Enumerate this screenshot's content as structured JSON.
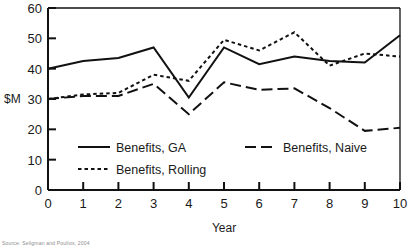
{
  "chart_data": {
    "type": "line",
    "title": "",
    "xlabel": "Year",
    "ylabel": "$M",
    "x": [
      0,
      1,
      2,
      3,
      4,
      5,
      6,
      7,
      8,
      9,
      10
    ],
    "xlim": [
      0,
      10
    ],
    "ylim": [
      0,
      60
    ],
    "xticks": [
      "0",
      "1",
      "2",
      "3",
      "4",
      "5",
      "6",
      "7",
      "8",
      "9",
      "10"
    ],
    "yticks": [
      "0",
      "10",
      "20",
      "30",
      "40",
      "50",
      "60"
    ],
    "grid": false,
    "legend_position": "inside-lower-left",
    "series": [
      {
        "name": "Benefits, GA",
        "style": "solid",
        "values": [
          40,
          42.5,
          43.5,
          47,
          30.5,
          47,
          41.5,
          44,
          42.5,
          42,
          51
        ]
      },
      {
        "name": "Benefits, Naive",
        "style": "long-dash",
        "values": [
          30,
          31,
          31,
          35,
          25,
          35.5,
          33,
          33.5,
          27,
          19.5,
          20.5
        ]
      },
      {
        "name": "Benefits, Rolling",
        "style": "dotted",
        "values": [
          30,
          31.5,
          32,
          38,
          36,
          49.5,
          46,
          52,
          41,
          45,
          44
        ]
      }
    ]
  },
  "legend": {
    "entries": [
      {
        "label": "Benefits, GA",
        "style": "solid"
      },
      {
        "label": "Benefits, Naive",
        "style": "long-dash"
      },
      {
        "label": "Benefits, Rolling",
        "style": "dotted"
      }
    ]
  },
  "caption": {
    "source": "Source: Seligman and Poulios, 2004"
  }
}
